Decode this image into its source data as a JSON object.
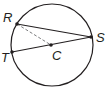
{
  "diagram": {
    "type": "circle-geometry",
    "circle": {
      "center": "C",
      "cx": 52,
      "cy": 45,
      "r": 41
    },
    "points": [
      {
        "name": "R",
        "x": 17,
        "y": 24,
        "label": "R",
        "lx": 3,
        "ly": 22
      },
      {
        "name": "S",
        "x": 91,
        "y": 37,
        "label": "S",
        "lx": 96,
        "ly": 42
      },
      {
        "name": "T",
        "x": 12,
        "y": 52,
        "label": "T",
        "lx": 1,
        "ly": 62
      },
      {
        "name": "C",
        "x": 51,
        "y": 45,
        "label": "C",
        "lx": 52,
        "ly": 60
      }
    ],
    "segments": [
      {
        "name": "RS",
        "from": "R",
        "to": "S",
        "style": "solid"
      },
      {
        "name": "TS",
        "from": "T",
        "to": "S",
        "style": "solid"
      },
      {
        "name": "RC",
        "from": "R",
        "to": "C",
        "style": "dashed"
      }
    ],
    "colors": {
      "stroke": "#231f20",
      "dashed": "#6d6e71"
    }
  }
}
